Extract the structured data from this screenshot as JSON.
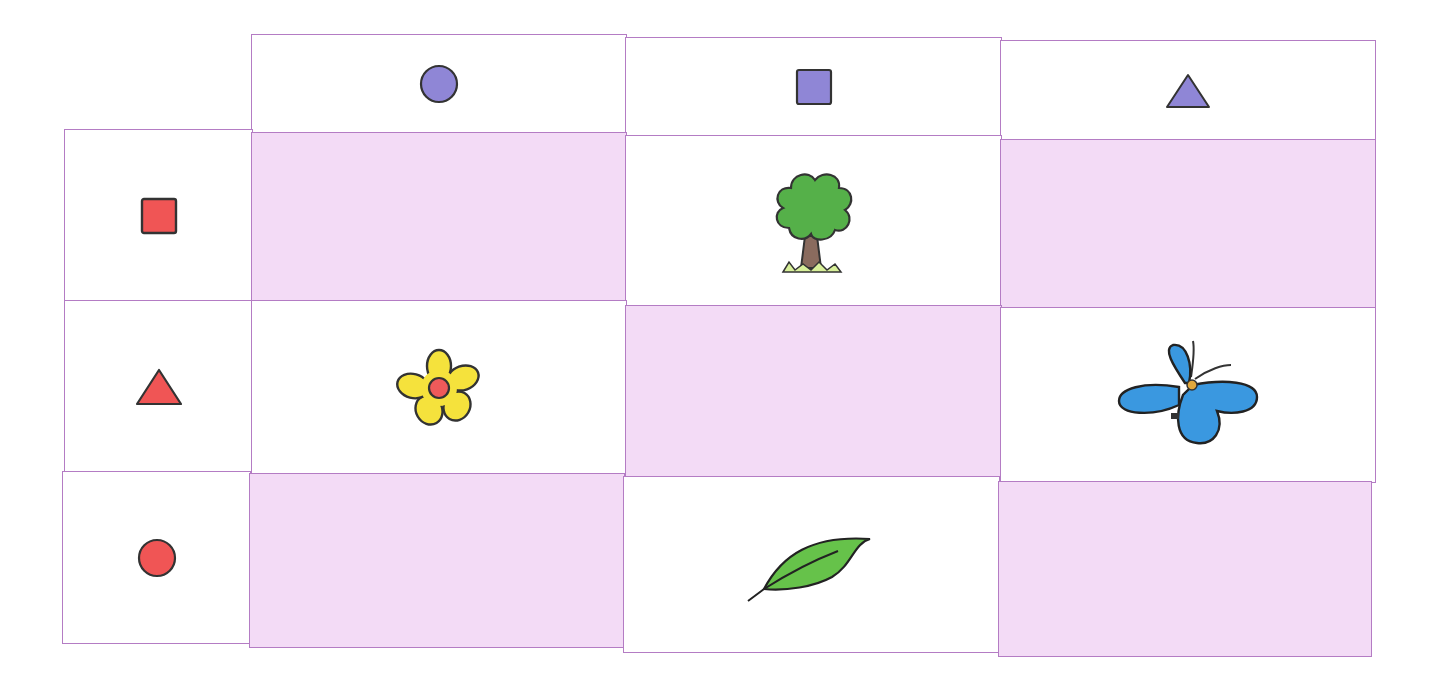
{
  "grid": {
    "line_color": "#b47cc4",
    "empty_fill": "#f3dbf6",
    "column_headers": [
      {
        "shape": "circle",
        "color": "#8f86d6",
        "icon": "purple-circle-icon"
      },
      {
        "shape": "square",
        "color": "#8f86d6",
        "icon": "purple-square-icon"
      },
      {
        "shape": "triangle",
        "color": "#8f86d6",
        "icon": "purple-triangle-icon"
      }
    ],
    "row_headers": [
      {
        "shape": "square",
        "color": "#f05555",
        "icon": "red-square-icon"
      },
      {
        "shape": "triangle",
        "color": "#f05555",
        "icon": "red-triangle-icon"
      },
      {
        "shape": "circle",
        "color": "#f05555",
        "icon": "red-circle-icon"
      }
    ],
    "cells": [
      [
        {
          "content": "empty"
        },
        {
          "content": "tree"
        },
        {
          "content": "empty"
        }
      ],
      [
        {
          "content": "flower"
        },
        {
          "content": "empty"
        },
        {
          "content": "butterfly"
        }
      ],
      [
        {
          "content": "empty"
        },
        {
          "content": "leaf"
        },
        {
          "content": "empty"
        }
      ]
    ]
  }
}
